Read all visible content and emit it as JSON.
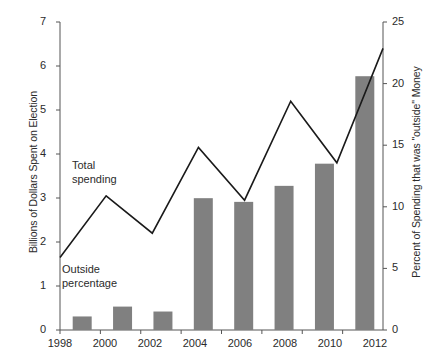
{
  "chart_data": {
    "type": "bar",
    "title": "",
    "subtitle": "",
    "categories": [
      "1998",
      "2000",
      "2002",
      "2004",
      "2006",
      "2008",
      "2010",
      "2012"
    ],
    "x": [
      1998,
      2000,
      2002,
      2004,
      2006,
      2008,
      2010,
      2012
    ],
    "series": [
      {
        "name": "Outside percentage",
        "type": "bar",
        "axis": "right",
        "unit": "percent",
        "color": "#808080",
        "values": [
          1.1,
          1.9,
          1.5,
          10.7,
          10.4,
          11.7,
          13.5,
          20.6
        ]
      },
      {
        "name": "Total spending",
        "type": "line",
        "axis": "left",
        "unit": "billions of dollars",
        "color": "#1a1a1a",
        "values": [
          1.65,
          3.05,
          2.2,
          4.15,
          2.95,
          5.2,
          3.8,
          6.4
        ]
      }
    ],
    "xlabel": "",
    "ylabel": "Billions of Dollars Spent on Election",
    "ylabel_right": "Percent of Spending that was \"outside\" Money",
    "ylim": [
      0,
      7
    ],
    "ylim_right": [
      0,
      25
    ],
    "yticks": [
      "0",
      "1",
      "2",
      "3",
      "4",
      "5",
      "6",
      "7"
    ],
    "yticks_right": [
      "0",
      "5",
      "10",
      "15",
      "20",
      "25"
    ],
    "xticks": [
      "1998",
      "2000",
      "2002",
      "2004",
      "2006",
      "2008",
      "2010",
      "2012"
    ],
    "grid": false,
    "legend_position": "inline-annotations",
    "annotations": [
      {
        "id": "line-label",
        "text_line1": "Total",
        "text_line2": "spending"
      },
      {
        "id": "bar-label",
        "text_line1": "Outside",
        "text_line2": "percentage"
      }
    ]
  },
  "axes": {
    "left": {
      "title": "Billions of Dollars Spent on Election",
      "ticks": [
        "0",
        "1",
        "2",
        "3",
        "4",
        "5",
        "6",
        "7"
      ]
    },
    "right": {
      "title": "Percent of Spending that was \"outside\" Money",
      "ticks": [
        "0",
        "5",
        "10",
        "15",
        "20",
        "25"
      ]
    },
    "bottom": {
      "ticks": [
        "1998",
        "2000",
        "2002",
        "2004",
        "2006",
        "2008",
        "2010",
        "2012"
      ]
    }
  },
  "annotations": {
    "line_label_1": "Total",
    "line_label_2": "spending",
    "bar_label_1": "Outside",
    "bar_label_2": "percentage"
  },
  "colors": {
    "bar_fill": "#808080",
    "line_stroke": "#1a1a1a",
    "axis": "#555555",
    "text": "#2b2b2b",
    "background": "#ffffff"
  }
}
